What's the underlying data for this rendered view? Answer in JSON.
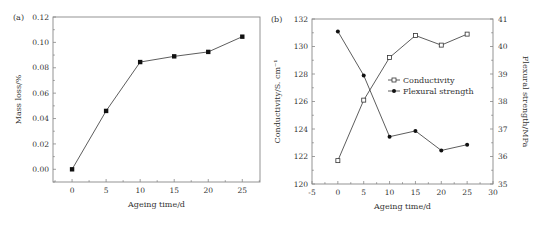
{
  "figure": {
    "background": "#ffffff",
    "line_color": "#333333",
    "frame_color": "#888888"
  },
  "chart_data": [
    {
      "panel": "(a)",
      "type": "line",
      "title": "",
      "xlabel": "Ageing time/d",
      "ylabel": "Mass loss/%",
      "x": [
        0,
        5,
        10,
        15,
        20,
        25
      ],
      "series": [
        {
          "name": "Mass loss",
          "marker": "filled-square",
          "values": [
            0.0,
            0.046,
            0.0845,
            0.089,
            0.0925,
            0.1045
          ]
        }
      ],
      "xlim": [
        -2.8,
        27.6
      ],
      "ylim": [
        -0.01,
        0.12
      ],
      "xticks": [
        0,
        5,
        10,
        15,
        20,
        25
      ],
      "yticks": [
        0.0,
        0.02,
        0.04,
        0.06,
        0.08,
        0.1,
        0.12
      ],
      "ytick_labels": [
        "0.00",
        "0.02",
        "0.04",
        "0.06",
        "0.08",
        "0.10",
        "0.12"
      ],
      "grid": false,
      "legend": null,
      "frame_px": {
        "left": 53,
        "top": 17,
        "right": 260,
        "bottom": 182
      }
    },
    {
      "panel": "(b)",
      "type": "line",
      "title": "",
      "xlabel": "Ageing time/d",
      "ylabel": "Conductivity/S. cm⁻¹",
      "ylabel_right": "Flexural strength/MPa",
      "x": [
        0,
        5,
        10,
        15,
        20,
        25
      ],
      "series": [
        {
          "name": "Conductivity",
          "axis": "left",
          "marker": "open-square",
          "values": [
            121.7,
            126.1,
            129.2,
            130.8,
            130.1,
            130.9
          ]
        },
        {
          "name": "Flexural strength",
          "axis": "right",
          "marker": "filled-circle",
          "values": [
            40.55,
            38.95,
            36.72,
            36.93,
            36.22,
            36.43
          ]
        }
      ],
      "xlim": [
        -5,
        30
      ],
      "ylim": [
        120,
        132
      ],
      "ylim_right": [
        35,
        41
      ],
      "xticks": [
        -5,
        0,
        5,
        10,
        15,
        20,
        25,
        30
      ],
      "yticks": [
        120,
        122,
        124,
        126,
        128,
        130,
        132
      ],
      "yticks_right": [
        35,
        36,
        37,
        38,
        39,
        40,
        41
      ],
      "grid": false,
      "legend": {
        "position": "center-right inside",
        "entries": [
          "Conductivity",
          "Flexural strength"
        ]
      },
      "frame_px": {
        "left": 312,
        "top": 19,
        "right": 493,
        "bottom": 184
      }
    }
  ]
}
